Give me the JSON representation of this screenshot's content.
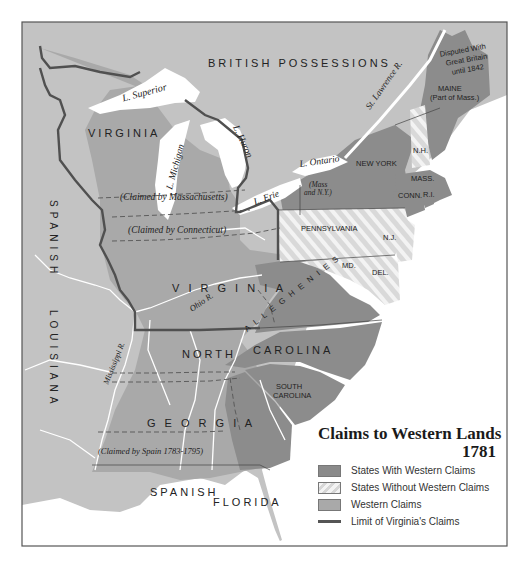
{
  "title": {
    "line1": "Claims to Western Lands",
    "line2": "1781"
  },
  "colors": {
    "water": "#ffffff",
    "foreign": "#c2c2c2",
    "western_claims": "#a8a8a8",
    "states_with_claims": "#8a8a8a",
    "states_without_claims_base": "#dcdcdc",
    "states_without_claims_stripe": "#f4f4f4",
    "virginia_limit": "#555555",
    "frame": "#555555"
  },
  "legend": {
    "items": [
      {
        "label": "States With Western Claims",
        "swatch": "states_with_claims"
      },
      {
        "label": "States Without Western Claims",
        "swatch": "states_without_claims"
      },
      {
        "label": "Western Claims",
        "swatch": "western_claims"
      },
      {
        "label": "Limit of Virginia's Claims",
        "swatch": "virginia_limit_line"
      }
    ]
  },
  "labels": {
    "british_possessions": "BRITISH   POSSESSIONS",
    "spanish": "SPANISH",
    "louisiana": "LOUISIANA",
    "spanish_florida_1": "SPANISH",
    "spanish_florida_2": "FLORIDA",
    "virginia_north": "VIRGINIA",
    "virginia_main": "V I R G I N I A",
    "claimed_mass": "(Claimed by Massachusetts)",
    "claimed_conn": "(Claimed by Connecticut)",
    "claimed_spain": "(Claimed by Spain 1783-1795)",
    "north_carolina_1": "NORTH",
    "north_carolina_2": "CAROLINA",
    "south_carolina_1": "SOUTH",
    "south_carolina_2": "CAROLINA",
    "georgia": "G E O R G I A",
    "pennsylvania": "PENNSYLVANIA",
    "new_york": "NEW YORK",
    "mass_ny_1": "(Mass",
    "mass_ny_2": "and N.Y.)",
    "nh": "N.H.",
    "mass": "MASS.",
    "conn": "CONN.",
    "ri": "R.I.",
    "nj": "N.J.",
    "md": "MD.",
    "del": "DEL.",
    "maine_1": "MAINE",
    "maine_2": "(Part of Mass.)",
    "disputed_1": "Disputed With",
    "disputed_2": "Great Britain",
    "disputed_3": "until 1842",
    "alleghenies": "A L L E G H E N I E S"
  },
  "water_labels": {
    "superior": "L. Superior",
    "michigan": "L. Michigan",
    "huron": "L. Huron",
    "erie": "L. Erie",
    "ontario": "L. Ontario",
    "st_lawrence": "St. Lawrence R.",
    "ohio": "Ohio R.",
    "mississippi": "Mississippi R."
  }
}
